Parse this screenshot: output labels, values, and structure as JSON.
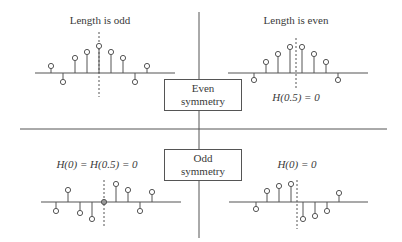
{
  "boxes": {
    "even": {
      "line1": "Even",
      "line2": "symmetry"
    },
    "odd": {
      "line1": "Odd",
      "line2": "symmetry"
    }
  },
  "panels": {
    "top_left": {
      "title": "Length is odd",
      "annotation": ""
    },
    "top_right": {
      "title": "Length is even",
      "annotation": "H(0.5) = 0"
    },
    "bottom_left": {
      "title": "",
      "annotation": "H(0) = H(0.5) = 0"
    },
    "bottom_right": {
      "title": "",
      "annotation": "H(0) = 0"
    }
  },
  "stems": {
    "top_left": {
      "axis_y": 73,
      "axis_x": [
        35,
        175
      ],
      "center_x": 99,
      "dash": [
        32,
        97
      ],
      "points": [
        [
          51,
          66
        ],
        [
          63,
          82
        ],
        [
          75,
          58
        ],
        [
          87,
          52
        ],
        [
          99,
          46
        ],
        [
          111,
          52
        ],
        [
          123,
          58
        ],
        [
          135,
          82
        ],
        [
          147,
          66
        ]
      ]
    },
    "top_right": {
      "axis_y": 73,
      "axis_x": [
        228,
        368
      ],
      "center_x": 296,
      "dash": [
        38,
        89
      ],
      "points": [
        [
          254,
          80
        ],
        [
          266,
          62
        ],
        [
          278,
          54
        ],
        [
          290,
          47
        ],
        [
          302,
          47
        ],
        [
          314,
          54
        ],
        [
          326,
          62
        ],
        [
          338,
          80
        ]
      ]
    },
    "bottom_left": {
      "axis_y": 202,
      "axis_x": [
        41,
        181
      ],
      "center_x": 104,
      "dash": [
        180,
        228
      ],
      "points": [
        [
          56,
          211
        ],
        [
          68,
          190
        ],
        [
          80,
          213
        ],
        [
          92,
          219
        ],
        [
          104,
          202
        ],
        [
          116,
          184
        ],
        [
          128,
          190
        ],
        [
          140,
          211
        ],
        [
          152,
          192
        ]
      ]
    },
    "bottom_right": {
      "axis_y": 202,
      "axis_x": [
        229,
        368
      ],
      "center_x": 297,
      "dash": [
        180,
        229
      ],
      "points": [
        [
          256,
          209
        ],
        [
          267,
          191
        ],
        [
          279,
          186
        ],
        [
          291,
          184
        ],
        [
          303,
          219
        ],
        [
          315,
          216
        ],
        [
          327,
          211
        ],
        [
          339,
          193
        ]
      ]
    }
  },
  "colors": {
    "line": "#555555",
    "text": "#3a3a3a"
  }
}
